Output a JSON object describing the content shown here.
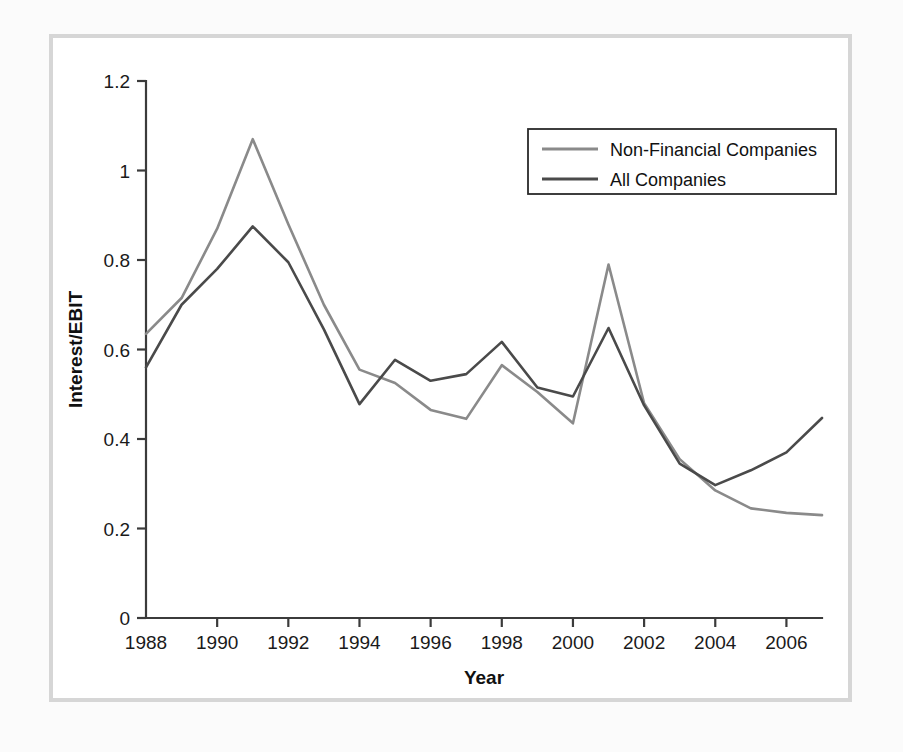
{
  "figure": {
    "frame_color": "#d6d6d6",
    "background_color": "#ffffff"
  },
  "chart_data": {
    "type": "line",
    "title": "",
    "subtitle": "",
    "xlabel": "Year",
    "ylabel": "Interest/EBIT",
    "xlim": [
      1988,
      2007
    ],
    "ylim": [
      0,
      1.2
    ],
    "grid": false,
    "legend_position": "top-right",
    "x": [
      1988,
      1989,
      1990,
      1991,
      1992,
      1993,
      1994,
      1995,
      1996,
      1997,
      1998,
      1999,
      2000,
      2001,
      2002,
      2003,
      2004,
      2005,
      2006,
      2007
    ],
    "xticks": [
      1988,
      1990,
      1992,
      1994,
      1996,
      1998,
      2000,
      2002,
      2004,
      2006
    ],
    "xtick_labels": [
      "1988",
      "1990",
      "1992",
      "1994",
      "1996",
      "1998",
      "2000",
      "2002",
      "2004",
      "2006"
    ],
    "yticks": [
      0,
      0.2,
      0.4,
      0.6,
      0.8,
      1,
      1.2
    ],
    "ytick_labels": [
      "0",
      "0.2",
      "0.4",
      "0.6",
      "0.8",
      "1",
      "1.2"
    ],
    "series": [
      {
        "name": "Non-Financial Companies",
        "color": "#8a8a8a",
        "values": [
          0.635,
          0.715,
          0.87,
          1.07,
          0.88,
          0.7,
          0.555,
          0.525,
          0.465,
          0.445,
          0.565,
          0.505,
          0.435,
          0.79,
          0.48,
          0.355,
          0.285,
          0.245,
          0.235,
          0.23
        ]
      },
      {
        "name": "All Companies",
        "color": "#4a4a4a",
        "values": [
          0.56,
          0.7,
          0.78,
          0.875,
          0.795,
          0.645,
          0.478,
          0.577,
          0.53,
          0.545,
          0.617,
          0.515,
          0.495,
          0.648,
          0.475,
          0.345,
          0.297,
          0.33,
          0.37,
          0.447
        ]
      }
    ],
    "legend": [
      {
        "label": "Non-Financial Companies",
        "color": "#8a8a8a"
      },
      {
        "label": "All Companies",
        "color": "#4a4a4a"
      }
    ]
  }
}
